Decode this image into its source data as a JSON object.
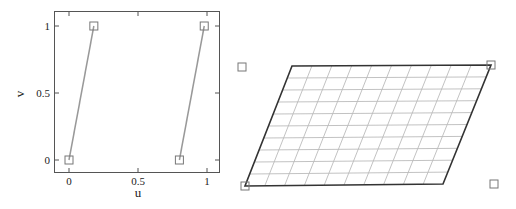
{
  "chart_data": [
    {
      "type": "line",
      "title": "",
      "xlabel": "u",
      "ylabel": "v",
      "xlim": [
        -0.1,
        1.1
      ],
      "ylim": [
        -0.1,
        1.1
      ],
      "x_ticks": [
        "0",
        "0.5",
        "1"
      ],
      "y_ticks": [
        "0",
        "0.5",
        "1"
      ],
      "grid": false,
      "legend": null,
      "series": [
        {
          "name": "segment-1",
          "points": [
            [
              0,
              0
            ],
            [
              0.18,
              1
            ]
          ],
          "marker": "square",
          "color": "#999999"
        },
        {
          "name": "segment-2",
          "points": [
            [
              0.8,
              0
            ],
            [
              0.98,
              1
            ]
          ],
          "marker": "square",
          "color": "#999999"
        }
      ]
    },
    {
      "type": "diagram",
      "title": "",
      "description": "Parallelogram mesh with 10x10 grid cells and four square control points",
      "grid_divisions": {
        "columns": 10,
        "rows": 10
      },
      "corners_px": {
        "bottom_left": [
          245,
          186
        ],
        "bottom_right": [
          443,
          184
        ],
        "top_right": [
          491,
          65
        ],
        "top_left": [
          292,
          66
        ]
      },
      "control_points_px": [
        [
          245,
          186
        ],
        [
          491,
          65
        ],
        [
          242,
          67
        ],
        [
          494,
          184
        ]
      ],
      "border_color": "#333333",
      "grid_color": "#bbbbbb"
    }
  ]
}
